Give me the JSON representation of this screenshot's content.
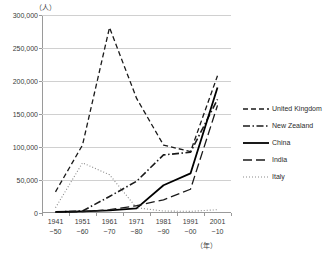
{
  "chart_data": {
    "type": "line",
    "title": "",
    "subtitle": "",
    "xlabel": "年",
    "ylabel": "（人）",
    "unit_label": "（人）",
    "x_unit_label": "（年）",
    "grid": true,
    "legend_position": "right",
    "ylim": [
      0,
      300000
    ],
    "ytick_values": [
      0,
      50000,
      100000,
      150000,
      200000,
      250000,
      300000
    ],
    "ytick_labels": [
      "0",
      "50,000",
      "100,000",
      "150,000",
      "200,000",
      "250,000",
      "300,000"
    ],
    "categories": [
      "1941\n~50",
      "1951\n~60",
      "1961\n~70",
      "1971\n~80",
      "1981\n~90",
      "1991\n~00",
      "2001\n~10"
    ],
    "category_lines": [
      {
        "top": "1941",
        "bottom": "~50"
      },
      {
        "top": "1951",
        "bottom": "~60"
      },
      {
        "top": "1961",
        "bottom": "~70"
      },
      {
        "top": "1971",
        "bottom": "~80"
      },
      {
        "top": "1981",
        "bottom": "~90"
      },
      {
        "top": "1991",
        "bottom": "~00"
      },
      {
        "top": "2001",
        "bottom": "~10"
      }
    ],
    "series": [
      {
        "name": "United Kingdom",
        "style": "dashed",
        "color": "#1a1a1a",
        "width": 1.3,
        "dash": "5,3",
        "values": [
          32000,
          103000,
          281000,
          174000,
          103000,
          93000,
          208000
        ]
      },
      {
        "name": "New Zealand",
        "style": "dash-dot",
        "color": "#1a1a1a",
        "width": 1.6,
        "dash": "7,2.5,1.5,2.5",
        "values": [
          1500,
          3000,
          25000,
          48000,
          88000,
          92000,
          172000
        ]
      },
      {
        "name": "China",
        "style": "solid",
        "color": "#000000",
        "width": 1.8,
        "dash": "none",
        "values": [
          1500,
          2500,
          4000,
          7000,
          42000,
          60000,
          190000
        ]
      },
      {
        "name": "India",
        "style": "long-dash",
        "color": "#1a1a1a",
        "width": 1.3,
        "dash": "9,4",
        "values": [
          1000,
          2000,
          5000,
          11000,
          20000,
          36000,
          163000
        ]
      },
      {
        "name": "Italy",
        "style": "dotted",
        "color": "#8a8a8a",
        "width": 1.1,
        "dash": "1,2",
        "values": [
          8000,
          76000,
          58000,
          8000,
          3000,
          2500,
          5000
        ]
      }
    ]
  }
}
